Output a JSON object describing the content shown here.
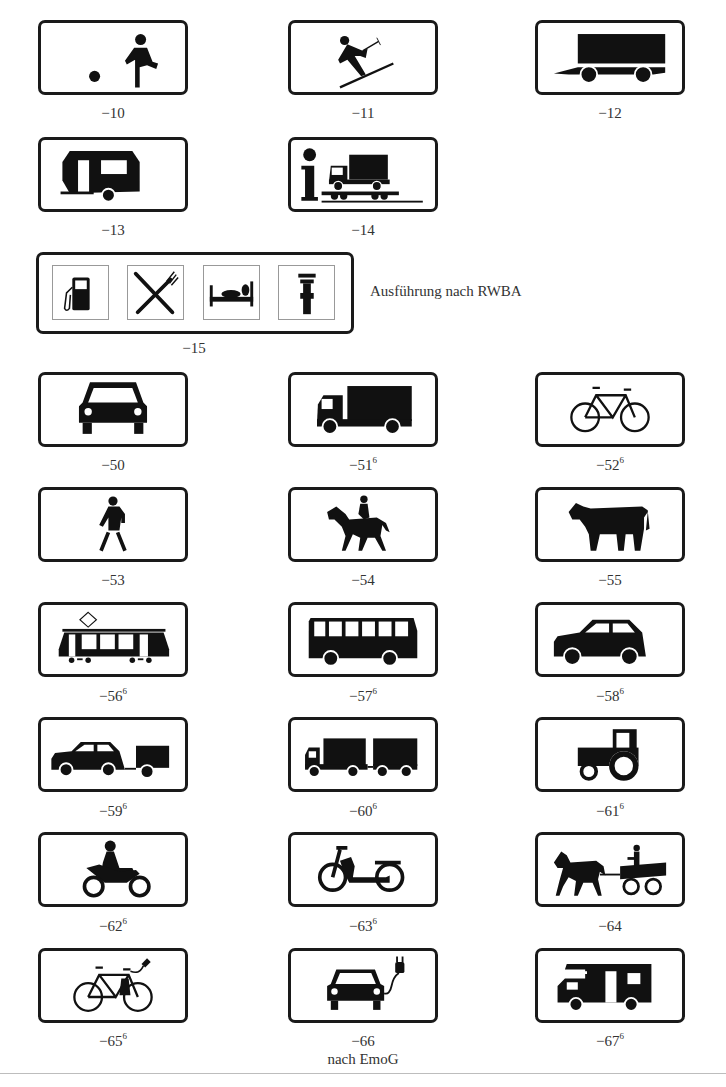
{
  "signs": [
    {
      "number": "−10",
      "sup": "",
      "icon": "child-playing-ball-icon"
    },
    {
      "number": "−11",
      "sup": "",
      "icon": "skier-icon"
    },
    {
      "number": "−12",
      "sup": "",
      "icon": "trailer-icon"
    },
    {
      "number": "−13",
      "sup": "",
      "icon": "caravan-icon"
    },
    {
      "number": "−14",
      "sup": "",
      "icon": "info-truck-on-rail-icon"
    },
    {
      "number": "−15",
      "sup": "",
      "icon": "services-panel"
    },
    {
      "number": "−50",
      "sup": "",
      "icon": "car-front-icon"
    },
    {
      "number": "−51",
      "sup": "6",
      "icon": "truck-icon"
    },
    {
      "number": "−52",
      "sup": "6",
      "icon": "bicycle-icon"
    },
    {
      "number": "−53",
      "sup": "",
      "icon": "pedestrian-icon"
    },
    {
      "number": "−54",
      "sup": "",
      "icon": "horse-rider-icon"
    },
    {
      "number": "−55",
      "sup": "",
      "icon": "cow-icon"
    },
    {
      "number": "−56",
      "sup": "6",
      "icon": "tram-icon"
    },
    {
      "number": "−57",
      "sup": "6",
      "icon": "bus-icon"
    },
    {
      "number": "−58",
      "sup": "6",
      "icon": "car-side-icon"
    },
    {
      "number": "−59",
      "sup": "6",
      "icon": "car-with-trailer-icon"
    },
    {
      "number": "−60",
      "sup": "6",
      "icon": "truck-with-trailer-icon"
    },
    {
      "number": "−61",
      "sup": "6",
      "icon": "tractor-icon"
    },
    {
      "number": "−62",
      "sup": "6",
      "icon": "motorcycle-icon"
    },
    {
      "number": "−63",
      "sup": "6",
      "icon": "moped-icon"
    },
    {
      "number": "−64",
      "sup": "",
      "icon": "horse-carriage-icon"
    },
    {
      "number": "−65",
      "sup": "6",
      "icon": "e-bike-icon"
    },
    {
      "number": "−66",
      "sup": "",
      "icon": "electric-car-icon"
    },
    {
      "number": "−67",
      "sup": "6",
      "icon": "motorhome-icon"
    }
  ],
  "services_panel": {
    "icons": [
      "fuel-pump-icon",
      "knife-fork-icon",
      "bed-icon",
      "wrench-icon"
    ],
    "note": "Ausführung nach RWBA"
  },
  "footnote_66": "nach EmoG"
}
